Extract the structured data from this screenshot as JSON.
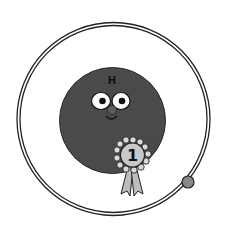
{
  "illustration": {
    "subject": "hydrogen atom character",
    "atom_symbol": "H",
    "ribbon_number": "1",
    "colors": {
      "background": "#ffffff",
      "body": "#4a4a4a",
      "outline": "#222222",
      "eye_white": "#ffffff",
      "pupil": "#111111",
      "nose": "#5a5a5a",
      "ribbon_face": "#c8c8c8",
      "ribbon_petals": "#d9d9d9",
      "ribbon_tails": "#bdbdbd",
      "electron": "#888888",
      "orbit": "#222222"
    }
  }
}
